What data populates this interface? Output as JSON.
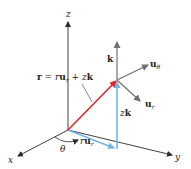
{
  "diagram": {
    "type": "cylindrical-coordinates-vector-diagram",
    "colors": {
      "axis": "#2a2a2a",
      "unit_vector": "#707070",
      "position_vector": "#e0262a",
      "component_vector": "#74b6e6",
      "background": "#ffffff"
    },
    "axes": {
      "x": {
        "label": "x"
      },
      "y": {
        "label": "y"
      },
      "z": {
        "label": "z"
      }
    },
    "angle_label": "θ",
    "position_vector": {
      "lhs": "r",
      "eq": " = ",
      "r_coef": "r",
      "u": "u",
      "u_sub": "r",
      "plus": " + ",
      "z_coef": "z",
      "k": "k"
    },
    "component_radial": {
      "coef": "r",
      "u": "u",
      "sub": "r"
    },
    "component_vertical": {
      "coef": "z",
      "k": "k"
    },
    "unit_vectors": {
      "k": {
        "label": "k"
      },
      "u_theta": {
        "u": "u",
        "sub": "θ"
      },
      "u_r": {
        "u": "u",
        "sub": "r"
      }
    }
  }
}
